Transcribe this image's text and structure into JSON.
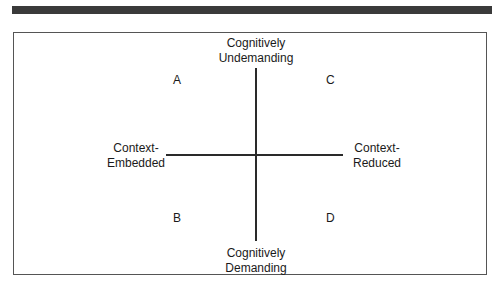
{
  "diagram": {
    "axes": {
      "top": "Cognitively\nUndemanding",
      "bottom": "Cognitively\nDemanding",
      "left": "Context-\nEmbedded",
      "right": "Context-\nReduced"
    },
    "quadrants": {
      "top_left": "A",
      "top_right": "C",
      "bottom_left": "B",
      "bottom_right": "D"
    },
    "colors": {
      "line": "#2a2a2a",
      "frame": "#555555",
      "top_bar": "#3a3a3a"
    }
  }
}
